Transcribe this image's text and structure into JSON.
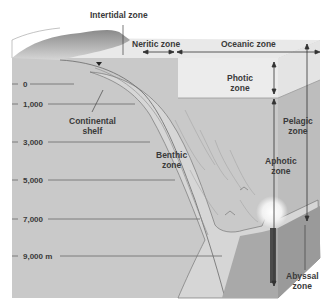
{
  "diagram": {
    "title_fragment": "",
    "horizontal_zones": {
      "intertidal": "Intertidal zone",
      "neritic": "Neritic zone",
      "oceanic": "Oceanic zone"
    },
    "vertical_zones": {
      "photic": [
        "Photic",
        "zone"
      ],
      "aphotic": [
        "Aphotic",
        "zone"
      ],
      "pelagic": [
        "Pelagic",
        "zone"
      ]
    },
    "bottom_zones": {
      "continental_shelf": [
        "Continental",
        "shelf"
      ],
      "benthic": [
        "Benthic",
        "zone"
      ],
      "abyssal": [
        "Abyssal",
        "zone"
      ]
    },
    "depth_scale": {
      "unit": "m",
      "ticks": [
        "0",
        "1,000",
        "3,000",
        "5,000",
        "7,000",
        "9,000 m"
      ]
    },
    "colors": {
      "water_front": "#c9c9c9",
      "water_surface": "#e6e6e6",
      "photic_layer": "#ececec",
      "seafloor": "#d8d8d8",
      "seafloor_side": "#a9a9a9",
      "line": "#555555",
      "text": "#3a3a3a",
      "background": "#ffffff"
    }
  }
}
